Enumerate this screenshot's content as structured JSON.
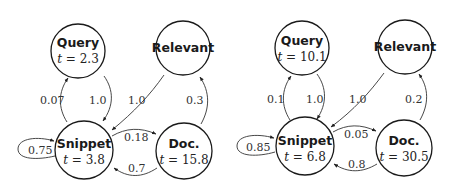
{
  "diagrams": [
    {
      "nodes": {
        "query": {
          "name": "Query",
          "t_label": "t = 2.3",
          "t_value": "2.3"
        },
        "relevant": {
          "name": "Relevant"
        },
        "snippet": {
          "name": "Snippet",
          "t_label": "t = 3.8",
          "t_value": "3.8"
        },
        "doc": {
          "name": "Doc.",
          "t_label": "t = 15.8",
          "t_value": "15.8"
        }
      },
      "edges": {
        "snippet_to_query": "0.07",
        "query_to_snippet": "1.0",
        "relevant_to_snippet": "1.0",
        "doc_to_relevant": "0.3",
        "snippet_to_doc": "0.18",
        "doc_to_snippet": "0.7",
        "snippet_self": "0.75"
      }
    },
    {
      "nodes": {
        "query": {
          "name": "Query",
          "t_label": "t = 10.1",
          "t_value": "10.1"
        },
        "relevant": {
          "name": "Relevant"
        },
        "snippet": {
          "name": "Snippet",
          "t_label": "t = 6.8",
          "t_value": "6.8"
        },
        "doc": {
          "name": "Doc.",
          "t_label": "t = 30.5",
          "t_value": "30.5"
        }
      },
      "edges": {
        "snippet_to_query": "0.1",
        "query_to_snippet": "1.0",
        "relevant_to_snippet": "1.0",
        "doc_to_relevant": "0.2",
        "snippet_to_doc": "0.05",
        "doc_to_snippet": "0.8",
        "snippet_self": "0.85"
      }
    }
  ]
}
